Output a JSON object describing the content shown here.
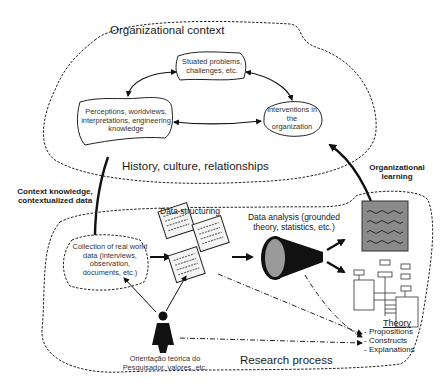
{
  "organizational_context": {
    "title": "Organizational context",
    "footer": "History, culture, relationships",
    "nodes": {
      "situated_problems": "Stuated problems, challenges, etc.",
      "perceptions": "Perceptions, worldviews, interpretations, engineering knowledge",
      "interventions": "Interventions in the organization"
    }
  },
  "flows": {
    "context_knowledge": "Context knowledge, contextualized data",
    "organizational_learning": "Organizational learning"
  },
  "research_process": {
    "title": "Research process",
    "collection": "Collection of real world data (interviews, observation, documents, etc.)",
    "data_structuring": "Data structuring",
    "data_analysis": "Data analysis (grounded theory, statistics, etc.)",
    "researcher": "Orientação teórica do Pesquisador, valores, etc.",
    "theory": {
      "heading": "Theory",
      "items": [
        "- Propositions",
        "- Constructs",
        "- Explanations"
      ]
    }
  },
  "colors": {
    "line": "#111111",
    "report_fill": "#8a8a8a",
    "cone_dark": "#111111",
    "cone_face": "#9a9a9a"
  }
}
